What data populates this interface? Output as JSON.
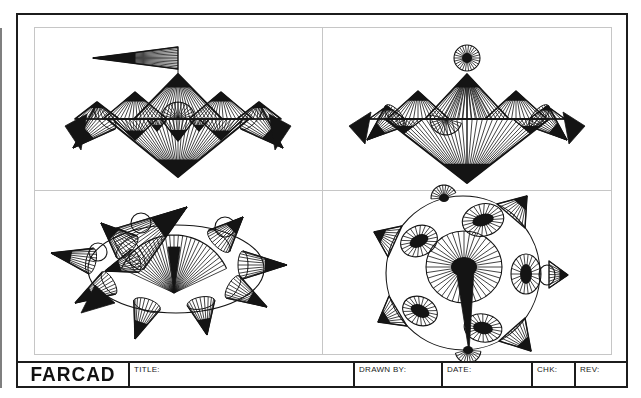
{
  "sheet": {
    "logo": "FARCAD",
    "title_label": "TITLE:",
    "drawn_by_label": "DRAWN BY:",
    "date_label": "DATE:",
    "chk_label": "CHK:",
    "rev_label": "REV:",
    "ink": "#141414",
    "grid_line": "#c6c6c6"
  },
  "drawings": [
    {
      "name": "mountain-with-pennant",
      "prims": [
        {
          "t": "fan",
          "a": [
            58,
            30
          ],
          "b": [
            143,
            19,
            143,
            41
          ],
          "n": 13,
          "o": 1.4,
          "tf": 0.5
        },
        {
          "t": "line",
          "p": [
            143,
            41,
            143,
            46
          ]
        },
        {
          "t": "fan",
          "a": [
            143,
            46
          ],
          "b": [
            99,
            91,
            187,
            91
          ],
          "n": 22,
          "o": 1.8,
          "tf": 0.3
        },
        {
          "t": "fan",
          "a": [
            100,
            64
          ],
          "b": [
            68,
            91,
            132,
            91
          ],
          "n": 15,
          "o": 1.6,
          "tf": 0.35
        },
        {
          "t": "fan",
          "a": [
            186,
            64
          ],
          "b": [
            154,
            91,
            218,
            91
          ],
          "n": 15,
          "o": 1.6,
          "tf": 0.35
        },
        {
          "t": "fan",
          "a": [
            62,
            74
          ],
          "b": [
            40,
            91,
            84,
            91
          ],
          "n": 11,
          "o": 1.6,
          "tf": 0.35
        },
        {
          "t": "fan",
          "a": [
            224,
            74
          ],
          "b": [
            202,
            91,
            246,
            91
          ],
          "n": 11,
          "o": 1.6,
          "tf": 0.35
        },
        {
          "t": "fan",
          "a": [
            122,
            103
          ],
          "b": [
            112,
            91,
            132,
            91
          ],
          "n": 8,
          "o": 1.2,
          "tf": 0.5
        },
        {
          "t": "fan",
          "a": [
            164,
            103
          ],
          "b": [
            154,
            91,
            174,
            91
          ],
          "n": 8,
          "o": 1.2,
          "tf": 0.5
        },
        {
          "t": "fan",
          "a": [
            100,
            112
          ],
          "b": [
            78,
            91,
            122,
            91
          ],
          "n": 11,
          "o": 1.4,
          "tf": 0.45
        },
        {
          "t": "fan",
          "a": [
            186,
            112
          ],
          "b": [
            164,
            91,
            208,
            91
          ],
          "n": 11,
          "o": 1.4,
          "tf": 0.45
        },
        {
          "t": "spokes",
          "c": [
            143,
            91
          ],
          "r": [
            17,
            17
          ],
          "arc": [
            180,
            360
          ],
          "n": 14
        },
        {
          "t": "fan",
          "a": [
            143,
            113
          ],
          "b": [
            126,
            91,
            160,
            91
          ],
          "n": 9,
          "o": 1.3,
          "tf": 0.5
        },
        {
          "t": "line",
          "p": [
            40,
            91,
            246,
            91
          ]
        },
        {
          "t": "fan",
          "a": [
            143,
            149
          ],
          "b": [
            72,
            91,
            214,
            91
          ],
          "n": 32,
          "o": 2,
          "tf": 0.3
        },
        {
          "t": "cone",
          "a": [
            38,
            120
          ],
          "b": [
            70,
            90
          ],
          "r": [
            15,
            6
          ],
          "n": 11
        },
        {
          "t": "cone",
          "a": [
            248,
            120
          ],
          "b": [
            216,
            90
          ],
          "r": [
            15,
            6
          ],
          "n": 11
        },
        {
          "t": "poly",
          "pts": [
            [
              30,
              98
            ],
            [
              52,
              86
            ],
            [
              46,
              122
            ]
          ],
          "f": 1
        },
        {
          "t": "poly",
          "pts": [
            [
              256,
              98
            ],
            [
              234,
              86
            ],
            [
              240,
              122
            ]
          ],
          "f": 1
        }
      ]
    },
    {
      "name": "mountain-with-sun",
      "prims": [
        {
          "t": "spokes",
          "c": [
            144,
            30
          ],
          "r": [
            13,
            13
          ],
          "n": 26,
          "core": [
            5,
            5
          ]
        },
        {
          "t": "fan",
          "a": [
            144,
            46
          ],
          "b": [
            102,
            91,
            186,
            91
          ],
          "n": 20,
          "o": 1.8,
          "tf": 0.3
        },
        {
          "t": "fan",
          "a": [
            144,
            46
          ],
          "b": [
            120,
            91,
            168,
            91
          ],
          "n": 10
        },
        {
          "t": "line",
          "p": [
            144,
            46,
            144,
            155
          ]
        },
        {
          "t": "fan",
          "a": [
            95,
            63
          ],
          "b": [
            64,
            91,
            126,
            91
          ],
          "n": 14,
          "o": 1.6,
          "tf": 0.35
        },
        {
          "t": "fan",
          "a": [
            193,
            63
          ],
          "b": [
            162,
            91,
            224,
            91
          ],
          "n": 14,
          "o": 1.6,
          "tf": 0.35
        },
        {
          "t": "fan",
          "a": [
            64,
            78
          ],
          "b": [
            46,
            91,
            82,
            91
          ],
          "n": 9,
          "o": 1.4,
          "tf": 0.35
        },
        {
          "t": "fan",
          "a": [
            224,
            78
          ],
          "b": [
            206,
            91,
            242,
            91
          ],
          "n": 9,
          "o": 1.4,
          "tf": 0.35
        },
        {
          "t": "spokes",
          "c": [
            123,
            91
          ],
          "r": [
            16,
            16
          ],
          "arc": [
            15,
            195
          ],
          "n": 13
        },
        {
          "t": "fan",
          "a": [
            81,
            105
          ],
          "b": [
            64,
            91,
            100,
            91
          ],
          "n": 9,
          "o": 1.2,
          "tf": 0.5
        },
        {
          "t": "fan",
          "a": [
            207,
            105
          ],
          "b": [
            190,
            91,
            226,
            91
          ],
          "n": 9,
          "o": 1.2,
          "tf": 0.5
        },
        {
          "t": "line",
          "p": [
            46,
            91,
            242,
            91
          ]
        },
        {
          "t": "fan",
          "a": [
            144,
            155
          ],
          "b": [
            62,
            91,
            226,
            91
          ],
          "n": 32,
          "o": 2,
          "tf": 0.3
        },
        {
          "t": "cone",
          "a": [
            44,
            112
          ],
          "b": [
            72,
            88
          ],
          "r": [
            14,
            6
          ],
          "n": 11
        },
        {
          "t": "cone",
          "a": [
            244,
            112
          ],
          "b": [
            216,
            88
          ],
          "r": [
            14,
            6
          ],
          "n": 11
        },
        {
          "t": "poly",
          "pts": [
            [
              26,
              98
            ],
            [
              48,
              84
            ],
            [
              42,
              116
            ]
          ],
          "f": 1
        },
        {
          "t": "poly",
          "pts": [
            [
              262,
              98
            ],
            [
              240,
              84
            ],
            [
              246,
              116
            ]
          ],
          "f": 1
        }
      ]
    },
    {
      "name": "spiked-crown-ellipse",
      "prims": [
        {
          "t": "ellipse",
          "c": [
            141,
            78
          ],
          "r": [
            88,
            44
          ]
        },
        {
          "t": "ellipse",
          "c": [
            106,
            32
          ],
          "r": [
            10,
            10
          ]
        },
        {
          "t": "ellipse",
          "c": [
            63,
            61
          ],
          "r": [
            9,
            9
          ]
        },
        {
          "t": "ellipse",
          "c": [
            190,
            36
          ],
          "r": [
            10,
            10
          ]
        },
        {
          "t": "arcfan",
          "a": [
            139,
            102
          ],
          "r": 58,
          "arc": [
            205,
            335
          ],
          "n": 30
        },
        {
          "t": "poly",
          "pts": [
            [
              139,
              102
            ],
            [
              133,
              56
            ],
            [
              145,
              56
            ]
          ],
          "f": 1
        },
        {
          "t": "cone",
          "a": [
            152,
            16
          ],
          "b": [
            94,
            58
          ],
          "r": [
            25,
            9
          ],
          "n": 16
        },
        {
          "t": "cone",
          "a": [
            16,
            62
          ],
          "b": [
            56,
            70
          ],
          "r": [
            13,
            5
          ],
          "n": 10
        },
        {
          "t": "cone",
          "a": [
            66,
            32
          ],
          "b": [
            92,
            56
          ],
          "r": [
            15,
            6
          ],
          "n": 12
        },
        {
          "t": "cone",
          "a": [
            40,
            112
          ],
          "b": [
            74,
            92
          ],
          "r": [
            13,
            5
          ],
          "n": 10
        },
        {
          "t": "cone",
          "a": [
            100,
            148
          ],
          "b": [
            112,
            114
          ],
          "r": [
            14,
            6
          ],
          "n": 10
        },
        {
          "t": "cone",
          "a": [
            172,
            144
          ],
          "b": [
            166,
            112
          ],
          "r": [
            14,
            6
          ],
          "n": 10
        },
        {
          "t": "cone",
          "a": [
            232,
            116
          ],
          "b": [
            198,
            96
          ],
          "r": [
            13,
            5
          ],
          "n": 10
        },
        {
          "t": "cone",
          "a": [
            252,
            74
          ],
          "b": [
            208,
            74
          ],
          "r": [
            14,
            5
          ],
          "n": 10
        },
        {
          "t": "cone",
          "a": [
            208,
            26
          ],
          "b": [
            184,
            50
          ],
          "r": [
            15,
            6
          ],
          "n": 12
        },
        {
          "t": "cone",
          "a": [
            70,
            80
          ],
          "b": [
            100,
            70
          ],
          "r": [
            12,
            5
          ],
          "n": 10
        },
        {
          "t": "poly",
          "pts": [
            [
              46,
              122
            ],
            [
              60,
              94
            ],
            [
              80,
              112
            ]
          ],
          "f": 1
        }
      ]
    },
    {
      "name": "spiked-orb",
      "prims": [
        {
          "t": "ellipse",
          "c": [
            140,
            82
          ],
          "r": [
            77,
            77
          ]
        },
        {
          "t": "fan",
          "a": [
            204,
            5
          ],
          "b": [
            174,
            13,
            202,
            37
          ],
          "n": 9,
          "o": 1.4,
          "tf": 0.45
        },
        {
          "t": "ellipse",
          "c": [
            224,
            84
          ],
          "r": [
            8,
            10
          ]
        },
        {
          "t": "fan",
          "a": [
            245,
            84
          ],
          "b": [
            226,
            70,
            226,
            97
          ],
          "n": 8,
          "o": 1.4,
          "tf": 0.45
        },
        {
          "t": "fan",
          "a": [
            208,
            160
          ],
          "b": [
            202,
            127,
            176,
            150
          ],
          "n": 9,
          "o": 1.4,
          "tf": 0.45
        },
        {
          "t": "fan",
          "a": [
            55,
            131
          ],
          "b": [
            84,
            135,
            66,
            105
          ],
          "n": 9,
          "o": 1.4,
          "tf": 0.45
        },
        {
          "t": "fan",
          "a": [
            51,
            41
          ],
          "b": [
            65,
            66,
            79,
            35
          ],
          "n": 9,
          "o": 1.4,
          "tf": 0.45
        },
        {
          "t": "spokes",
          "c": [
            121,
            7
          ],
          "r": [
            13,
            13
          ],
          "arc": [
            176,
            336
          ],
          "n": 11,
          "core": [
            5,
            4
          ]
        },
        {
          "t": "spokes",
          "c": [
            145,
            159
          ],
          "r": [
            13,
            13
          ],
          "arc": [
            6,
            166
          ],
          "n": 11,
          "core": [
            5,
            4
          ]
        },
        {
          "t": "spokes",
          "c": [
            160,
            29
          ],
          "r": [
            21,
            16
          ],
          "rot": -15,
          "n": 24,
          "core": [
            11,
            6
          ]
        },
        {
          "t": "spokes",
          "c": [
            96,
            50
          ],
          "r": [
            19,
            15
          ],
          "rot": -25,
          "n": 22,
          "core": [
            10,
            6
          ]
        },
        {
          "t": "spokes",
          "c": [
            203,
            83
          ],
          "r": [
            15,
            20
          ],
          "n": 22,
          "core": [
            6,
            10
          ]
        },
        {
          "t": "spokes",
          "c": [
            97,
            120
          ],
          "r": [
            18,
            14
          ],
          "rot": 25,
          "n": 22,
          "core": [
            10,
            6
          ]
        },
        {
          "t": "spokes",
          "c": [
            160,
            137
          ],
          "r": [
            19,
            14
          ],
          "rot": 10,
          "n": 22,
          "core": [
            10,
            6
          ]
        },
        {
          "t": "spokes",
          "c": [
            141,
            76
          ],
          "r": [
            38,
            36
          ],
          "n": 40,
          "core": [
            13,
            10
          ]
        },
        {
          "t": "poly",
          "pts": [
            [
              133,
              78
            ],
            [
              151,
              78
            ],
            [
              146,
              161
            ]
          ],
          "f": 1
        }
      ]
    }
  ]
}
